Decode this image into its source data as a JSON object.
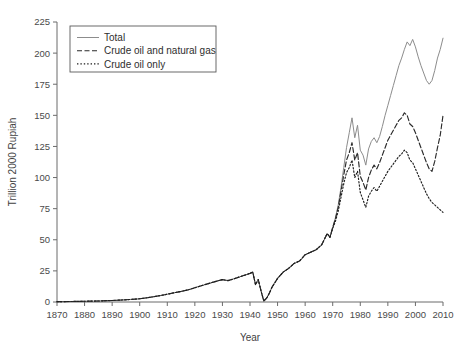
{
  "chart_data": {
    "type": "line",
    "title": "",
    "xlabel": "Year",
    "ylabel": "Trillion 2000 Rupiah",
    "xlim": [
      1870,
      2010
    ],
    "ylim": [
      0,
      225
    ],
    "xticks": [
      1870,
      1880,
      1890,
      1900,
      1910,
      1920,
      1930,
      1940,
      1950,
      1960,
      1970,
      1980,
      1990,
      2000,
      2010
    ],
    "yticks": [
      0,
      25,
      50,
      75,
      100,
      125,
      150,
      175,
      200,
      225
    ],
    "grid": false,
    "legend_position": "upper left",
    "series": [
      {
        "name": "Total",
        "style": "solid",
        "color": "#8c8c8c",
        "x": [
          1870,
          1875,
          1880,
          1885,
          1890,
          1895,
          1900,
          1903,
          1906,
          1909,
          1912,
          1915,
          1918,
          1920,
          1922,
          1924,
          1926,
          1928,
          1930,
          1932,
          1934,
          1936,
          1938,
          1940,
          1941,
          1942,
          1943,
          1944,
          1945,
          1946,
          1947,
          1948,
          1950,
          1952,
          1954,
          1956,
          1958,
          1960,
          1962,
          1964,
          1966,
          1968,
          1969,
          1970,
          1971,
          1972,
          1973,
          1974,
          1975,
          1976,
          1977,
          1978,
          1979,
          1980,
          1981,
          1982,
          1983,
          1984,
          1985,
          1986,
          1987,
          1988,
          1989,
          1990,
          1991,
          1992,
          1993,
          1994,
          1995,
          1996,
          1997,
          1998,
          1999,
          2000,
          2001,
          2002,
          2003,
          2004,
          2005,
          2006,
          2007,
          2008,
          2009,
          2010
        ],
        "values": [
          0.3,
          0.4,
          0.6,
          0.8,
          1.2,
          1.8,
          2.6,
          3.5,
          4.6,
          5.8,
          7.2,
          8.5,
          10.0,
          11.5,
          12.8,
          14.2,
          15.5,
          16.8,
          18.0,
          17.2,
          18.5,
          20.0,
          21.5,
          23.0,
          24.0,
          14.0,
          18.0,
          9.0,
          0.8,
          3.0,
          7.0,
          12.0,
          19.0,
          24.0,
          27.0,
          31.0,
          33.0,
          38.0,
          40.0,
          42.0,
          46.0,
          55.0,
          52.0,
          60.0,
          68.0,
          78.0,
          92.0,
          108.0,
          124.0,
          136.0,
          148.0,
          132.0,
          142.0,
          122.0,
          118.0,
          110.0,
          123.0,
          129.0,
          132.0,
          128.0,
          133.0,
          141.0,
          150.0,
          158.0,
          166.0,
          174.0,
          182.0,
          190.0,
          196.0,
          203.0,
          209.0,
          206.0,
          211.0,
          205.0,
          197.0,
          190.0,
          184.0,
          178.0,
          175.0,
          178.0,
          186.0,
          196.0,
          203.0,
          212.0
        ]
      },
      {
        "name": "Crude oil and natural gas",
        "style": "dashed",
        "color": "#2a2a2a",
        "x": [
          1870,
          1875,
          1880,
          1885,
          1890,
          1895,
          1900,
          1903,
          1906,
          1909,
          1912,
          1915,
          1918,
          1920,
          1922,
          1924,
          1926,
          1928,
          1930,
          1932,
          1934,
          1936,
          1938,
          1940,
          1941,
          1942,
          1943,
          1944,
          1945,
          1946,
          1947,
          1948,
          1950,
          1952,
          1954,
          1956,
          1958,
          1960,
          1962,
          1964,
          1966,
          1968,
          1969,
          1970,
          1971,
          1972,
          1973,
          1974,
          1975,
          1976,
          1977,
          1978,
          1979,
          1980,
          1981,
          1982,
          1983,
          1984,
          1985,
          1986,
          1987,
          1988,
          1989,
          1990,
          1991,
          1992,
          1993,
          1994,
          1995,
          1996,
          1997,
          1998,
          1999,
          2000,
          2001,
          2002,
          2003,
          2004,
          2005,
          2006,
          2007,
          2008,
          2009,
          2010
        ],
        "values": [
          0.3,
          0.4,
          0.6,
          0.8,
          1.2,
          1.8,
          2.6,
          3.5,
          4.6,
          5.8,
          7.2,
          8.5,
          10.0,
          11.5,
          12.8,
          14.2,
          15.5,
          16.8,
          18.0,
          17.2,
          18.5,
          20.0,
          21.5,
          23.0,
          24.0,
          14.0,
          18.0,
          9.0,
          0.8,
          3.0,
          7.0,
          12.0,
          19.0,
          24.0,
          27.0,
          31.0,
          33.0,
          38.0,
          40.0,
          42.0,
          46.0,
          55.0,
          52.0,
          60.0,
          67.0,
          76.0,
          89.0,
          102.0,
          114.0,
          120.0,
          128.0,
          114.0,
          120.0,
          101.0,
          96.0,
          90.0,
          100.0,
          106.0,
          110.0,
          107.0,
          112.0,
          118.0,
          124.0,
          130.0,
          134.0,
          138.0,
          142.0,
          146.0,
          148.0,
          152.0,
          150.0,
          143.0,
          141.0,
          136.0,
          130.0,
          124.0,
          118.0,
          112.0,
          107.0,
          105.0,
          113.0,
          124.0,
          134.0,
          150.0
        ]
      },
      {
        "name": "Crude oil only",
        "style": "dotted",
        "color": "#1f1f1f",
        "x": [
          1870,
          1875,
          1880,
          1885,
          1890,
          1895,
          1900,
          1903,
          1906,
          1909,
          1912,
          1915,
          1918,
          1920,
          1922,
          1924,
          1926,
          1928,
          1930,
          1932,
          1934,
          1936,
          1938,
          1940,
          1941,
          1942,
          1943,
          1944,
          1945,
          1946,
          1947,
          1948,
          1950,
          1952,
          1954,
          1956,
          1958,
          1960,
          1962,
          1964,
          1966,
          1968,
          1969,
          1970,
          1971,
          1972,
          1973,
          1974,
          1975,
          1976,
          1977,
          1978,
          1979,
          1980,
          1981,
          1982,
          1983,
          1984,
          1985,
          1986,
          1987,
          1988,
          1989,
          1990,
          1991,
          1992,
          1993,
          1994,
          1995,
          1996,
          1997,
          1998,
          1999,
          2000,
          2001,
          2002,
          2003,
          2004,
          2005,
          2006,
          2007,
          2008,
          2009,
          2010
        ],
        "values": [
          0.3,
          0.4,
          0.6,
          0.8,
          1.2,
          1.8,
          2.6,
          3.5,
          4.6,
          5.8,
          7.2,
          8.5,
          10.0,
          11.5,
          12.8,
          14.2,
          15.5,
          16.8,
          18.0,
          17.2,
          18.5,
          20.0,
          21.5,
          23.0,
          24.0,
          14.0,
          18.0,
          9.0,
          0.8,
          3.0,
          7.0,
          12.0,
          19.0,
          24.0,
          27.0,
          31.0,
          33.0,
          38.0,
          40.0,
          42.0,
          46.0,
          55.0,
          52.0,
          59.0,
          65.0,
          73.0,
          84.0,
          95.0,
          104.0,
          108.0,
          114.0,
          100.0,
          105.0,
          88.0,
          82.0,
          76.0,
          85.0,
          89.0,
          92.0,
          89.0,
          93.0,
          97.0,
          101.0,
          105.0,
          108.0,
          111.0,
          114.0,
          117.0,
          119.0,
          122.0,
          120.0,
          114.0,
          112.0,
          107.0,
          102.0,
          97.0,
          92.0,
          87.0,
          83.0,
          80.0,
          78.0,
          76.0,
          74.0,
          72.0
        ]
      }
    ]
  },
  "axes": {
    "ylabel": "Trillion 2000 Rupiah",
    "xlabel": "Year",
    "ytick_labels": [
      "0",
      "25",
      "50",
      "75",
      "100",
      "125",
      "150",
      "175",
      "200",
      "225"
    ],
    "xtick_labels": [
      "1870",
      "1880",
      "1890",
      "1900",
      "1910",
      "1920",
      "1930",
      "1940",
      "1950",
      "1960",
      "1970",
      "1980",
      "1990",
      "2000",
      "2010"
    ]
  },
  "legend": {
    "items": [
      {
        "label": "Total",
        "style": "solid"
      },
      {
        "label": "Crude oil and natural gas",
        "style": "dashed"
      },
      {
        "label": "Crude oil only",
        "style": "dotted"
      }
    ]
  },
  "colors": {
    "total": "#8c8c8c",
    "oil_gas": "#2a2a2a",
    "oil_only": "#1f1f1f",
    "axis": "#6b6b6b",
    "background": "#ffffff"
  }
}
